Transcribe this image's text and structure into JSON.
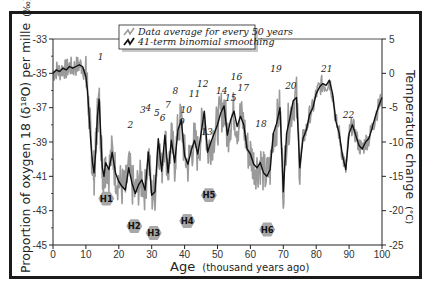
{
  "chart_data": {
    "type": "line",
    "title": "",
    "xlabel": "Age",
    "xlabel_unit": "(thousand years ago)",
    "ylabel": "Proportion of oxygen 18 (δ¹⁸O) per mille (‰)",
    "ylabel_right": "Temperature change (°C)",
    "xlim": [
      0,
      100
    ],
    "ylim": [
      -45,
      -33
    ],
    "ylim_right": [
      -25,
      5
    ],
    "x_ticks": [
      0,
      10,
      20,
      30,
      40,
      50,
      60,
      70,
      80,
      90,
      100
    ],
    "y_ticks": [
      -33,
      -35,
      -37,
      -39,
      -41,
      -43,
      -45
    ],
    "y_ticks_right": [
      5,
      0,
      -5,
      -10,
      -15,
      -20,
      -25
    ],
    "grid": false,
    "legend_position": "top",
    "legend": [
      {
        "label": "Data average for every 50 years",
        "color": "#9a9a9a"
      },
      {
        "label": "41-term binomial smoothing",
        "color": "#111111"
      }
    ],
    "series": [
      {
        "name": "41-term binomial smoothing",
        "x": [
          0,
          1,
          2,
          3,
          4,
          5,
          6,
          7,
          8,
          9,
          10,
          10.5,
          11,
          11.5,
          12,
          12.5,
          13,
          13.5,
          14,
          14.5,
          15,
          15.5,
          16,
          17,
          18,
          19,
          20,
          21,
          22,
          23,
          24,
          25,
          26,
          27,
          28,
          29,
          30,
          31,
          32,
          33,
          34,
          35,
          36,
          37,
          38,
          39,
          40,
          41,
          42,
          43,
          44,
          45,
          46,
          47,
          48,
          49,
          50,
          51,
          52,
          53,
          54,
          55,
          56,
          57,
          58,
          59,
          60,
          61,
          62,
          63,
          64,
          65,
          66,
          67,
          68,
          69,
          70,
          71,
          72,
          73,
          74,
          75,
          76,
          77,
          78,
          79,
          80,
          81,
          82,
          83,
          84,
          85,
          86,
          87,
          88,
          89,
          90,
          91,
          92,
          93,
          94,
          95,
          96,
          97,
          98,
          99,
          100
        ],
        "values": [
          -35.0,
          -34.8,
          -34.9,
          -34.7,
          -34.8,
          -34.6,
          -34.7,
          -34.6,
          -34.5,
          -34.6,
          -35.2,
          -36.0,
          -37.5,
          -39.0,
          -40.2,
          -40.8,
          -39.5,
          -37.5,
          -36.5,
          -38.5,
          -40.5,
          -41.0,
          -40.2,
          -40.6,
          -39.6,
          -40.8,
          -41.3,
          -41.6,
          -41.8,
          -40.5,
          -41.4,
          -42.0,
          -41.5,
          -41.2,
          -41.8,
          -39.6,
          -42.1,
          -41.9,
          -38.8,
          -40.7,
          -38.6,
          -40.8,
          -38.9,
          -40.2,
          -38.3,
          -37.7,
          -39.8,
          -40.3,
          -39.5,
          -38.9,
          -39.7,
          -38.5,
          -37.2,
          -39.6,
          -39.0,
          -38.5,
          -38.0,
          -37.3,
          -36.9,
          -38.6,
          -37.7,
          -37.2,
          -38.1,
          -37.5,
          -38.0,
          -39.4,
          -39.7,
          -40.3,
          -40.5,
          -40.2,
          -40.8,
          -41.0,
          -40.6,
          -38.5,
          -37.9,
          -37.0,
          -41.9,
          -38.5,
          -37.6,
          -36.6,
          -36.4,
          -40.5,
          -38.8,
          -38.3,
          -37.4,
          -37.0,
          -36.2,
          -35.8,
          -35.6,
          -35.7,
          -35.4,
          -36.2,
          -37.8,
          -38.5,
          -39.8,
          -40.6,
          -38.5,
          -38.0,
          -38.6,
          -39.2,
          -39.4,
          -39.0,
          -38.8,
          -38.2,
          -37.5,
          -36.9,
          -36.4
        ]
      }
    ],
    "annotations": {
      "interstadials": [
        {
          "label": "1",
          "x": 14.5,
          "y": -34.2
        },
        {
          "label": "2",
          "x": 23.5,
          "y": -38.2
        },
        {
          "label": "3",
          "x": 27.3,
          "y": -37.3
        },
        {
          "label": "4",
          "x": 29.0,
          "y": -37.2
        },
        {
          "label": "5",
          "x": 31.6,
          "y": -37.5
        },
        {
          "label": "6",
          "x": 33.3,
          "y": -37.8
        },
        {
          "label": "7",
          "x": 34.9,
          "y": -37.0
        },
        {
          "label": "8",
          "x": 37.2,
          "y": -36.2
        },
        {
          "label": "9",
          "x": 39.2,
          "y": -38.0
        },
        {
          "label": "10",
          "x": 40.5,
          "y": -37.3
        },
        {
          "label": "11",
          "x": 43.0,
          "y": -36.4
        },
        {
          "label": "12",
          "x": 45.5,
          "y": -35.8
        },
        {
          "label": "13",
          "x": 46.8,
          "y": -38.6
        },
        {
          "label": "14",
          "x": 51.3,
          "y": -36.2
        },
        {
          "label": "15",
          "x": 54.0,
          "y": -36.6
        },
        {
          "label": "16",
          "x": 55.8,
          "y": -35.4
        },
        {
          "label": "17",
          "x": 57.8,
          "y": -36.0
        },
        {
          "label": "18",
          "x": 63.2,
          "y": -38.1
        },
        {
          "label": "19",
          "x": 67.8,
          "y": -34.9
        },
        {
          "label": "20",
          "x": 72.3,
          "y": -35.9
        },
        {
          "label": "21",
          "x": 83.2,
          "y": -34.9
        },
        {
          "label": "22",
          "x": 89.8,
          "y": -37.6
        }
      ],
      "heinrich_events": [
        {
          "label": "H1",
          "x": 16.2,
          "y": -42.3
        },
        {
          "label": "H2",
          "x": 24.7,
          "y": -43.9
        },
        {
          "label": "H3",
          "x": 30.6,
          "y": -44.3
        },
        {
          "label": "H4",
          "x": 40.8,
          "y": -43.6
        },
        {
          "label": "H5",
          "x": 47.4,
          "y": -42.1
        },
        {
          "label": "H6",
          "x": 65.1,
          "y": -44.1
        }
      ]
    }
  },
  "axes": {
    "left_ticks": [
      "-33",
      "-35",
      "-37",
      "-39",
      "-41",
      "-43",
      "-45"
    ],
    "right_ticks": [
      "5",
      "0",
      "-5",
      "-10",
      "-15",
      "-20",
      "-25"
    ],
    "bottom_ticks": [
      "0",
      "10",
      "20",
      "30",
      "40",
      "50",
      "60",
      "70",
      "80",
      "90",
      "100"
    ],
    "left_label": "Proportion of oxygen 18 (δ¹⁸O) per mille",
    "left_label_unit": "(‰)",
    "right_label": "Temperature change",
    "right_label_unit": "(°C)",
    "bottom_label": "Age",
    "bottom_label_unit": "(thousand years ago)"
  },
  "legend": {
    "items": [
      {
        "label": "Data average for every 50 years"
      },
      {
        "label": "41-term binomial smoothing"
      }
    ]
  },
  "colors": {
    "raw_series": "#9a9a9a",
    "smooth_series": "#111111",
    "heinrich_badge": "#a8a8a8",
    "frame": "#1a1a1a"
  }
}
